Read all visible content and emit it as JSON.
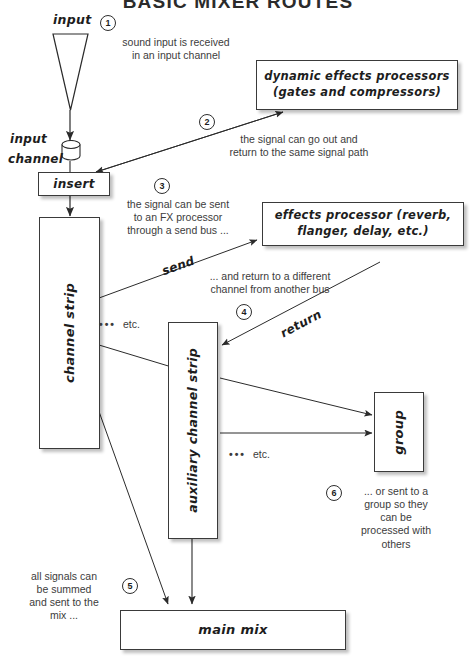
{
  "title": "BASIC MIXER ROUTES",
  "nodes": {
    "input_label": "input",
    "input_channel_label_line1": "input",
    "input_channel_label_line2": "channel",
    "insert": "insert",
    "channel_strip": "channel strip",
    "auxiliary_channel_strip": "auxiliary channel strip",
    "group": "group",
    "main_mix": "main mix",
    "dynamic_effects_line1": "dynamic effects processors",
    "dynamic_effects_line2": "(gates and compressors)",
    "effects_processor_line1": "effects processor (reverb,",
    "effects_processor_line2": "flanger, delay, etc.)"
  },
  "edge_labels": {
    "send": "send",
    "return": "return"
  },
  "etc_markers": [
    {
      "dots": "•••",
      "label": "etc."
    },
    {
      "dots": "•••",
      "label": "etc."
    }
  ],
  "steps": [
    {
      "number": "1",
      "text_lines": [
        "sound input is received",
        "in an input channel"
      ]
    },
    {
      "number": "2",
      "text_lines": [
        "the signal can go out and",
        "return to the same signal path"
      ]
    },
    {
      "number": "3",
      "text_lines": [
        "the signal can be sent",
        "to an FX processor",
        "through a send bus ..."
      ]
    },
    {
      "number": "4",
      "text_lines": [
        "... and return to a different",
        "channel from another bus"
      ]
    },
    {
      "number": "5",
      "text_lines": [
        "all signals can",
        "be summed",
        "and sent to the",
        "mix ..."
      ]
    },
    {
      "number": "6",
      "text_lines": [
        "... or sent to a",
        "group so they",
        "can be",
        "processed with",
        "others"
      ]
    }
  ],
  "colors": {
    "ink": "#2b2b2b",
    "line": "#3a3a3a",
    "background": "#ffffff"
  }
}
